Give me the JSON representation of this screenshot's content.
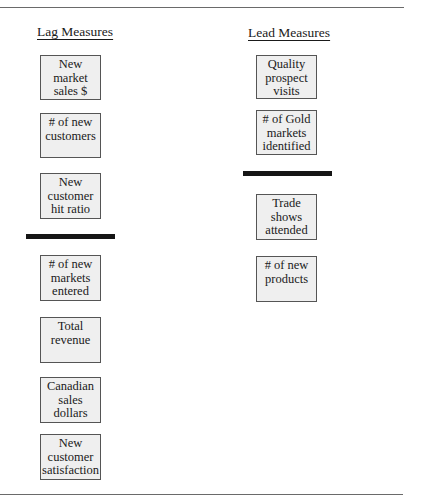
{
  "diagram": {
    "lag": {
      "heading": "Lag Measures",
      "items": [
        {
          "lines": [
            "New",
            "market",
            "sales $"
          ]
        },
        {
          "lines": [
            "# of new",
            "customers"
          ]
        },
        {
          "lines": [
            "New",
            "customer",
            "hit ratio"
          ]
        },
        {
          "lines": [
            "# of new",
            "markets",
            "entered"
          ]
        },
        {
          "lines": [
            "Total",
            "revenue"
          ]
        },
        {
          "lines": [
            "Canadian",
            "sales",
            "dollars"
          ]
        },
        {
          "lines": [
            "New",
            "customer",
            "satisfaction"
          ]
        }
      ]
    },
    "lead": {
      "heading": "Lead Measures",
      "items": [
        {
          "lines": [
            "Quality",
            "prospect",
            "visits"
          ]
        },
        {
          "lines": [
            "# of Gold",
            "markets",
            "identified"
          ]
        },
        {
          "lines": [
            "Trade",
            "shows",
            "attended"
          ]
        },
        {
          "lines": [
            "# of new",
            "products"
          ]
        }
      ]
    }
  }
}
